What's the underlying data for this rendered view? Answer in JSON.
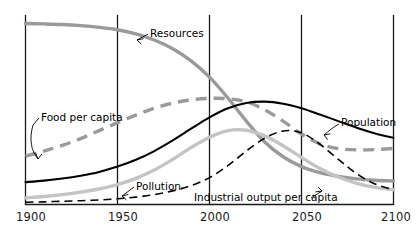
{
  "chart_data": {
    "type": "line",
    "title": "",
    "subtitle": "",
    "xlabel": "",
    "ylabel": "",
    "xlim": [
      1900,
      2100
    ],
    "ylim": [
      0,
      1
    ],
    "grid": "vertical-only",
    "legend_position": "inline-annotations",
    "axis_ticks": [
      "1900",
      "1950",
      "2000",
      "2050",
      "2100"
    ],
    "gridline_years": [
      1900,
      1950,
      2000,
      2050,
      2100
    ],
    "colors": {
      "resources": "#9a9a9a",
      "food_per_capita": "#9a9a9a",
      "population": "#000000",
      "industrial_output_per_capita": "#c4c4c4",
      "pollution": "#000000",
      "axis": "#1a1a1a",
      "background": "#ffffff"
    },
    "series": [
      {
        "name": "Resources",
        "color": "#9a9a9a",
        "style": "solid",
        "width": 3.4,
        "label_text": "Resources",
        "x": [
          1900,
          1910,
          1920,
          1930,
          1940,
          1950,
          1960,
          1970,
          1980,
          1990,
          2000,
          2010,
          2020,
          2030,
          2040,
          2050,
          2060,
          2070,
          2080,
          2090,
          2100
        ],
        "values": [
          0.955,
          0.953,
          0.95,
          0.944,
          0.935,
          0.922,
          0.9,
          0.868,
          0.822,
          0.758,
          0.672,
          0.562,
          0.44,
          0.33,
          0.252,
          0.2,
          0.168,
          0.148,
          0.135,
          0.128,
          0.124
        ]
      },
      {
        "name": "Food per capita",
        "color": "#9a9a9a",
        "style": "dashed",
        "width": 3.4,
        "label_text": "Food per capita",
        "x": [
          1900,
          1910,
          1920,
          1930,
          1940,
          1950,
          1960,
          1970,
          1980,
          1990,
          2000,
          2010,
          2020,
          2030,
          2040,
          2050,
          2060,
          2070,
          2080,
          2090,
          2100
        ],
        "values": [
          0.255,
          0.282,
          0.312,
          0.348,
          0.39,
          0.432,
          0.472,
          0.508,
          0.535,
          0.552,
          0.56,
          0.558,
          0.542,
          0.5,
          0.44,
          0.372,
          0.32,
          0.295,
          0.288,
          0.29,
          0.296
        ]
      },
      {
        "name": "Population",
        "color": "#000000",
        "style": "solid",
        "width": 2.1,
        "label_text": "Population",
        "x": [
          1900,
          1910,
          1920,
          1930,
          1940,
          1950,
          1960,
          1970,
          1980,
          1990,
          2000,
          2010,
          2020,
          2030,
          2040,
          2050,
          2060,
          2070,
          2080,
          2090,
          2100
        ],
        "values": [
          0.118,
          0.126,
          0.137,
          0.152,
          0.172,
          0.2,
          0.236,
          0.282,
          0.338,
          0.4,
          0.46,
          0.508,
          0.536,
          0.543,
          0.532,
          0.508,
          0.475,
          0.44,
          0.405,
          0.375,
          0.352
        ]
      },
      {
        "name": "Industrial output per capita",
        "color": "#c4c4c4",
        "style": "solid",
        "width": 3.4,
        "label_text": "Industrial output per capita",
        "x": [
          1900,
          1910,
          1920,
          1930,
          1940,
          1950,
          1960,
          1970,
          1980,
          1990,
          2000,
          2010,
          2020,
          2030,
          2040,
          2050,
          2060,
          2070,
          2080,
          2090,
          2100
        ],
        "values": [
          0.035,
          0.042,
          0.052,
          0.065,
          0.082,
          0.105,
          0.138,
          0.182,
          0.238,
          0.3,
          0.355,
          0.39,
          0.392,
          0.362,
          0.31,
          0.248,
          0.19,
          0.145,
          0.112,
          0.09,
          0.078
        ]
      },
      {
        "name": "Pollution",
        "color": "#000000",
        "style": "dashed",
        "width": 1.6,
        "label_text": "Pollution",
        "x": [
          1900,
          1910,
          1920,
          1930,
          1940,
          1950,
          1960,
          1970,
          1980,
          1990,
          2000,
          2010,
          2020,
          2030,
          2040,
          2050,
          2060,
          2070,
          2080,
          2090,
          2100
        ],
        "values": [
          0.012,
          0.014,
          0.017,
          0.02,
          0.024,
          0.03,
          0.039,
          0.052,
          0.072,
          0.1,
          0.142,
          0.205,
          0.282,
          0.35,
          0.388,
          0.378,
          0.318,
          0.238,
          0.162,
          0.108,
          0.078
        ]
      }
    ],
    "annotations": [
      {
        "text": "Resources",
        "target_series": "Resources"
      },
      {
        "text": "Food per capita",
        "target_series": "Food per capita"
      },
      {
        "text": "Population",
        "target_series": "Population"
      },
      {
        "text": "Pollution",
        "target_series": "Pollution"
      },
      {
        "text": "Industrial output per capita",
        "target_series": "Industrial output per capita"
      }
    ]
  },
  "labels": {
    "resources": "Resources",
    "food_per_capita": "Food per capita",
    "population": "Population",
    "pollution": "Pollution",
    "industrial_output": "Industrial output per capita"
  },
  "ticks": {
    "t1900": "1900",
    "t1950": "1950",
    "t2000": "2000",
    "t2050": "2050",
    "t2100": "2100"
  }
}
